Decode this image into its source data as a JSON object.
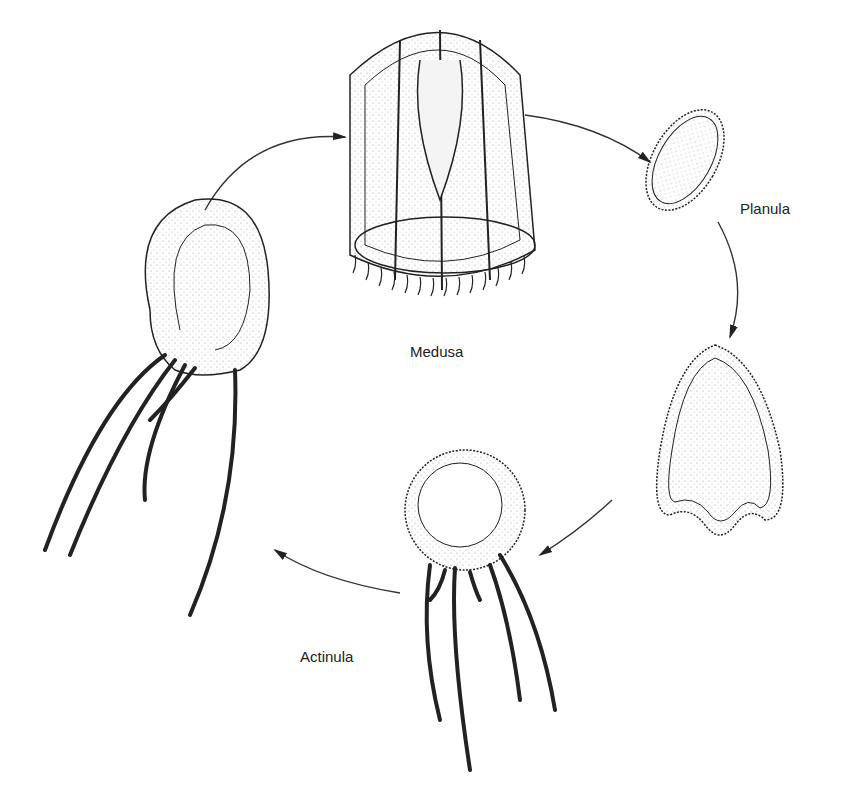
{
  "diagram": {
    "type": "life-cycle",
    "stages": [
      {
        "id": "medusa",
        "label": "Medusa"
      },
      {
        "id": "planula",
        "label": "Planula"
      },
      {
        "id": "planula-settled",
        "label": ""
      },
      {
        "id": "actinula",
        "label": "Actinula"
      },
      {
        "id": "polyp-juvenile",
        "label": ""
      }
    ],
    "arrows": [
      {
        "from": "polyp-juvenile",
        "to": "medusa"
      },
      {
        "from": "medusa",
        "to": "planula"
      },
      {
        "from": "planula",
        "to": "planula-settled"
      },
      {
        "from": "planula-settled",
        "to": "actinula"
      },
      {
        "from": "actinula",
        "to": "polyp-juvenile"
      }
    ],
    "colors": {
      "ink": "#222222",
      "background": "#ffffff",
      "stipple": "#888888"
    }
  }
}
